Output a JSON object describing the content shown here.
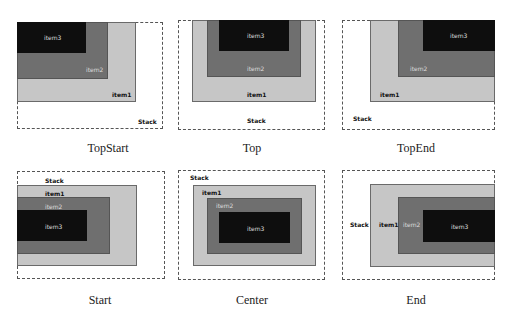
{
  "panels": [
    {
      "caption": "TopStart",
      "stack_label": "Stack",
      "item1": "item1",
      "item2": "item2",
      "item3": "item3"
    },
    {
      "caption": "Top",
      "stack_label": "Stack",
      "item1": "item1",
      "item2": "item2",
      "item3": "item3"
    },
    {
      "caption": "TopEnd",
      "stack_label": "Stack",
      "item1": "item1",
      "item2": "item2",
      "item3": "item3"
    },
    {
      "caption": "Start",
      "stack_label": "Stack",
      "item1": "item1",
      "item2": "item2",
      "item3": "item3"
    },
    {
      "caption": "Center",
      "stack_label": "Stack",
      "item1": "item1",
      "item2": "item2",
      "item3": "item3"
    },
    {
      "caption": "End",
      "stack_label": "Stack",
      "item1": "item1",
      "item2": "item2",
      "item3": "item3"
    }
  ],
  "colors": {
    "item1": "#c6c6c6",
    "item2": "#6f6f6f",
    "item3": "#0e0e0e"
  }
}
